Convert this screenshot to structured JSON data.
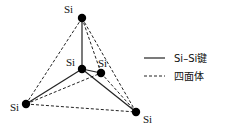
{
  "diagram": {
    "atoms": [
      {
        "id": "top",
        "label": "Si"
      },
      {
        "id": "center",
        "label": "Si"
      },
      {
        "id": "back",
        "label": "Si"
      },
      {
        "id": "left",
        "label": "Si"
      },
      {
        "id": "right",
        "label": "Si"
      }
    ],
    "bonds": [
      {
        "from": "center",
        "to": "top",
        "style": "solid"
      },
      {
        "from": "center",
        "to": "left",
        "style": "solid"
      },
      {
        "from": "center",
        "to": "right",
        "style": "solid"
      },
      {
        "from": "center",
        "to": "back",
        "style": "solid"
      }
    ],
    "tetrahedron_edges": [
      {
        "from": "top",
        "to": "left",
        "style": "dashed"
      },
      {
        "from": "top",
        "to": "right",
        "style": "dashed"
      },
      {
        "from": "top",
        "to": "back",
        "style": "dashed"
      },
      {
        "from": "left",
        "to": "right",
        "style": "dashed"
      },
      {
        "from": "left",
        "to": "back",
        "style": "dashed"
      },
      {
        "from": "back",
        "to": "right",
        "style": "dashed"
      }
    ]
  },
  "legend": {
    "solid_label": "Si–Si键",
    "dashed_label": "四面体"
  },
  "colors": {
    "line": "#222222",
    "atom": "#000000"
  }
}
